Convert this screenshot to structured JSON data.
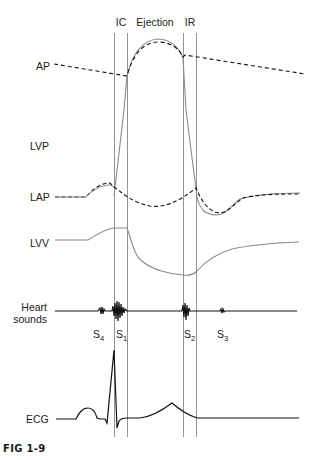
{
  "phases": {
    "ic": "IC",
    "ejection": "Ejection",
    "ir": "IR"
  },
  "traces": {
    "ap": "AP",
    "lvp": "LVP",
    "lap": "LAP",
    "lvv": "LVV",
    "heart_sounds_line1": "Heart",
    "heart_sounds_line2": "sounds",
    "ecg": "ECG"
  },
  "sounds": {
    "s4": {
      "base": "S",
      "sub": "4"
    },
    "s1": {
      "base": "S",
      "sub": "1"
    },
    "s2": {
      "base": "S",
      "sub": "2"
    },
    "s3": {
      "base": "S",
      "sub": "3"
    }
  },
  "caption": "FIG 1-9",
  "colors": {
    "trace_gray": "#8a8a8a",
    "trace_black": "#111111",
    "divider": "#777777"
  }
}
